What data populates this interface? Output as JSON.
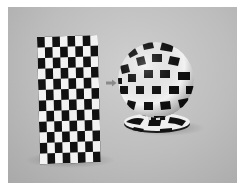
{
  "scene": {
    "description": "Texture mapping illustration: flat checkerboard plane mapped onto a sphere",
    "background_color": "#bdbdbd",
    "checker_dark": "#111111",
    "checker_light": "#f2f2f2",
    "plane": {
      "cols": 8,
      "rows": 12
    },
    "arrow": {
      "direction": "right",
      "color": "#8a8a8a"
    },
    "sphere": {
      "cx": 156,
      "cy": 80,
      "r": 38
    },
    "pedestal": {
      "cx": 157,
      "cy": 122,
      "rx": 33,
      "ry": 9
    }
  }
}
